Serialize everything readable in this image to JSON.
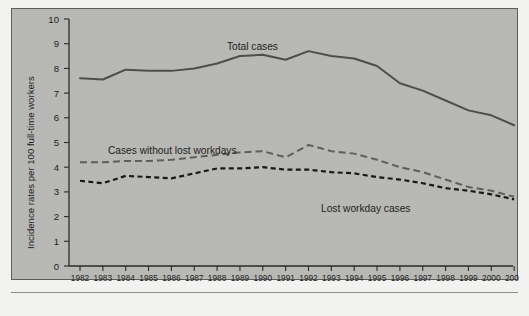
{
  "chart_data": {
    "type": "line",
    "title": "",
    "xlabel": "",
    "ylabel": "Incidence rates per 100 full-time workers",
    "ylim": [
      0,
      10
    ],
    "yticks": [
      0,
      1,
      2,
      3,
      4,
      5,
      6,
      7,
      8,
      9,
      10
    ],
    "grid": false,
    "legend_position": "inline-annotations",
    "categories": [
      "1982",
      "1983",
      "1984",
      "1985",
      "1986",
      "1987",
      "1988",
      "1989",
      "1990",
      "1991",
      "1992",
      "1993",
      "1994",
      "1995",
      "1996",
      "1997",
      "1998",
      "1999",
      "2000",
      "2001"
    ],
    "series": [
      {
        "name": "Total cases",
        "style": "solid",
        "color": "#4d4d4b",
        "values": [
          7.6,
          7.55,
          7.95,
          7.9,
          7.9,
          8.0,
          8.2,
          8.5,
          8.55,
          8.35,
          8.7,
          8.5,
          8.4,
          8.1,
          7.4,
          7.1,
          6.7,
          6.3,
          6.1,
          5.7
        ]
      },
      {
        "name": "Cases without lost workdays",
        "style": "dashed",
        "color": "#5e5e5c",
        "values": [
          4.2,
          4.2,
          4.25,
          4.25,
          4.3,
          4.4,
          4.5,
          4.6,
          4.65,
          4.4,
          4.9,
          4.65,
          4.55,
          4.3,
          4.0,
          3.8,
          3.5,
          3.2,
          3.05,
          2.8
        ]
      },
      {
        "name": "Lost workday cases",
        "style": "dotted-dash",
        "color": "#17171a",
        "values": [
          3.45,
          3.35,
          3.65,
          3.6,
          3.55,
          3.75,
          3.95,
          3.95,
          4.0,
          3.9,
          3.9,
          3.8,
          3.75,
          3.6,
          3.5,
          3.35,
          3.15,
          3.05,
          2.9,
          2.7
        ]
      }
    ],
    "annotations": [
      {
        "text": "Total cases",
        "series": "Total cases"
      },
      {
        "text": "Cases without lost workdays",
        "series": "Cases without lost workdays"
      },
      {
        "text": "Lost workday cases",
        "series": "Lost workday cases"
      }
    ]
  },
  "colors": {
    "figure_background": "#b9b9b6",
    "page_background": "#f2f2f0",
    "frame_border": "#5d5d5b",
    "axis": "#2a2a28"
  }
}
